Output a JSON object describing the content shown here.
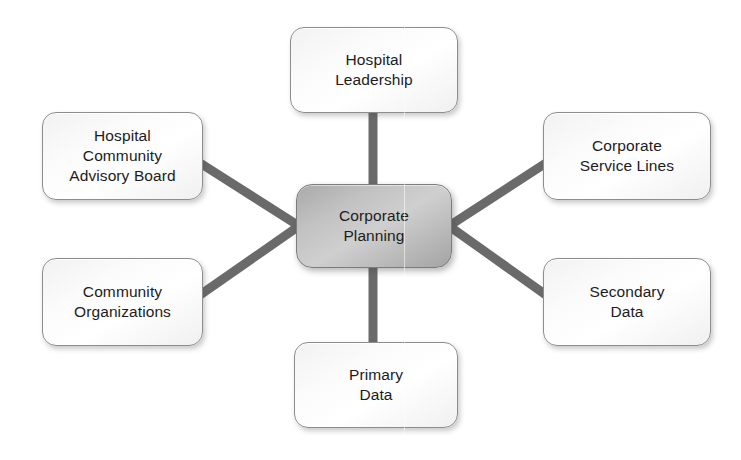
{
  "diagram": {
    "type": "hub-and-spoke",
    "canvas": {
      "width": 741,
      "height": 460,
      "background": "#ffffff"
    },
    "colors": {
      "connector": "#6a6a6a",
      "hub_fill": "#c2c2c2",
      "spoke_fill": "#fafafa",
      "node_border": "#8d8d8d",
      "text": "#1c1c1c"
    },
    "hub": {
      "id": "corporate-planning",
      "label": "Corporate\nPlanning",
      "x": 296,
      "y": 184,
      "width": 156,
      "height": 84
    },
    "spokes": [
      {
        "id": "hospital-leadership",
        "label": "Hospital\nLeadership",
        "position": "top",
        "x": 290,
        "y": 27,
        "width": 168,
        "height": 86
      },
      {
        "id": "corporate-service-lines",
        "label": "Corporate\nService Lines",
        "position": "top-right",
        "x": 543,
        "y": 112,
        "width": 168,
        "height": 88
      },
      {
        "id": "secondary-data",
        "label": "Secondary\nData",
        "position": "bottom-right",
        "x": 543,
        "y": 258,
        "width": 168,
        "height": 88
      },
      {
        "id": "primary-data",
        "label": "Primary\nData",
        "position": "bottom",
        "x": 294,
        "y": 342,
        "width": 164,
        "height": 86
      },
      {
        "id": "community-organizations",
        "label": "Community\nOrganizations",
        "position": "bottom-left",
        "x": 42,
        "y": 258,
        "width": 161,
        "height": 88
      },
      {
        "id": "hospital-community-advisory-board",
        "label": "Hospital\nCommunity\nAdvisory Board",
        "position": "top-left",
        "x": 42,
        "y": 112,
        "width": 161,
        "height": 88
      }
    ],
    "connectors": [
      {
        "id": "hub-to-hospital-leadership",
        "from": "corporate-planning",
        "to": "hospital-leadership",
        "orientation": "vertical"
      },
      {
        "id": "hub-to-primary-data",
        "from": "corporate-planning",
        "to": "primary-data",
        "orientation": "vertical"
      },
      {
        "id": "hub-to-hospital-community-advisory-board",
        "from": "corporate-planning",
        "to": "hospital-community-advisory-board",
        "orientation": "diagonal"
      },
      {
        "id": "hub-to-community-organizations",
        "from": "corporate-planning",
        "to": "community-organizations",
        "orientation": "diagonal"
      },
      {
        "id": "hub-to-corporate-service-lines",
        "from": "corporate-planning",
        "to": "corporate-service-lines",
        "orientation": "diagonal"
      },
      {
        "id": "hub-to-secondary-data",
        "from": "corporate-planning",
        "to": "secondary-data",
        "orientation": "diagonal"
      }
    ]
  }
}
